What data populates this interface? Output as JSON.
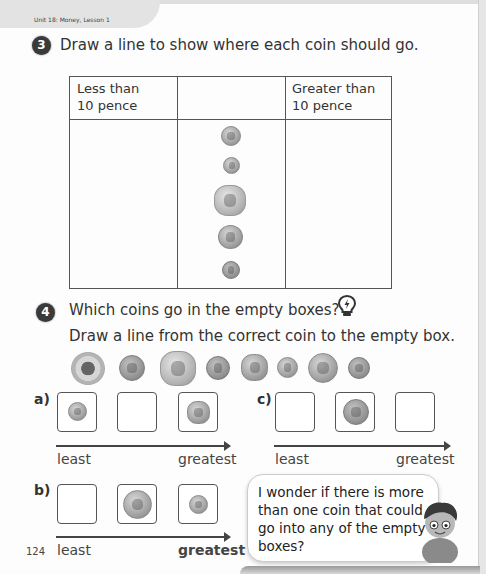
{
  "header": {
    "unit_label": "Unit 18: Money, Lesson 1"
  },
  "question3": {
    "number": "3",
    "instruction": "Draw a line to show where each coin should go.",
    "table": {
      "headers": [
        "Less than\n10 pence",
        "",
        "Greater than\n10 pence"
      ],
      "header_left_line1": "Less than",
      "header_left_line2": "10 pence",
      "header_right_line1": "Greater than",
      "header_right_line2": "10 pence",
      "coins_middle_column": [
        "coin-silver-small",
        "coin-silver-tiny",
        "coin-hepta-large",
        "coin-silver-medium",
        "coin-copper-small"
      ]
    }
  },
  "question4": {
    "number": "4",
    "question": "Which coins go in the empty boxes?",
    "hint_icon": "lightbulb-icon",
    "instruction": "Draw a line from the correct coin to the empty box.",
    "coin_row": [
      "coin-ring",
      "coin-copper",
      "coin-hepta-large",
      "coin-copper-medium",
      "coin-silver-hepta",
      "coin-silver-small",
      "coin-silver-large",
      "coin-copper-small"
    ],
    "parts": [
      {
        "label": "a)",
        "boxes": [
          "coin",
          "empty",
          "coin"
        ],
        "least": "least",
        "greatest": "greatest"
      },
      {
        "label": "b)",
        "boxes": [
          "empty",
          "coin",
          "coin"
        ],
        "least": "least",
        "greatest": "greatest"
      },
      {
        "label": "c)",
        "boxes": [
          "empty",
          "coin",
          "empty"
        ],
        "least": "least",
        "greatest": "greatest"
      }
    ]
  },
  "speech_bubble": {
    "text": "I wonder if there is more than one coin that could go into any of the empty boxes?"
  },
  "footer": {
    "page_number": "124"
  }
}
